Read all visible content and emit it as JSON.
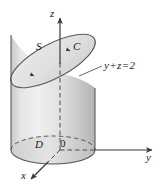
{
  "figure": {
    "type": "math-diagram-3d",
    "axes": {
      "z_label": "z",
      "y_label": "y",
      "x_label": "x",
      "origin_label": "0"
    },
    "labels": {
      "surface": "S",
      "curve": "C",
      "region": "D"
    },
    "plane_equation": {
      "lhs_first": "y",
      "operator_plus": "+",
      "lhs_second": "z",
      "operator_equals": "=",
      "rhs": "2",
      "full": "y + z = 2"
    },
    "colors": {
      "outline": "#5a5a5a",
      "fill_light": "#e8e8e8",
      "fill_mid": "#d5d5d5",
      "fill_dark": "#b9b9b9",
      "top_fill": "#e2e2e2",
      "text": "#1a1a1a",
      "background": "#ffffff"
    }
  }
}
